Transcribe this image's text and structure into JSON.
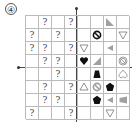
{
  "figure_label": "④",
  "grid": {
    "rows": 8,
    "cols": 8,
    "cells": [
      [
        "",
        "?",
        "",
        "?",
        "",
        "",
        "tri-gray-bl",
        ""
      ],
      [
        "?",
        "",
        "?",
        "",
        "",
        "nosign-black",
        "",
        "tri-white-down"
      ],
      [
        "?",
        "?",
        "",
        "?",
        "tri-white-down",
        "",
        "tri-gray-left",
        ""
      ],
      [
        "",
        "?",
        "?",
        "",
        "heart-black",
        "tri-gray-br",
        "",
        "nosign-white"
      ],
      [
        "",
        "",
        "?",
        "",
        "",
        "trapezoid-black",
        "",
        "heart-white-inverted"
      ],
      [
        "",
        "?",
        "",
        "?",
        "tri-white-up",
        "nosign-gray",
        "pentagon-black",
        ""
      ],
      [
        "",
        "?",
        "?",
        "",
        "",
        "pentagon-black",
        "tri-gray-left",
        "trapezoid-gray-left"
      ],
      [
        "?",
        "",
        "",
        "?",
        "",
        "",
        "tri-white-down",
        ""
      ]
    ]
  },
  "colors": {
    "black": "#111111",
    "gray": "#a0a0a0",
    "white_stroke": "#777777",
    "grid": "#bbbbbb"
  }
}
